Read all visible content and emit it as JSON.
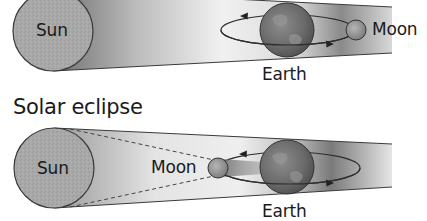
{
  "top_panel": {
    "title": "",
    "labels": {
      "sun": "Sun",
      "earth": "Earth",
      "moon": "Moon"
    }
  },
  "bottom_panel": {
    "title": "Solar eclipse",
    "labels": {
      "sun": "Sun",
      "moon": "Moon",
      "earth": "Earth"
    }
  },
  "colors": {
    "background": "#ffffff",
    "sun_fill": "#a9a9a9",
    "band_dark": "#7d7d7d",
    "band_light": "#f2f2f2",
    "earth_fill": "#6e6e6e",
    "moon_fill": "#9a9a9a",
    "outline": "#3a3a3a",
    "text": "#1a1a1a"
  }
}
